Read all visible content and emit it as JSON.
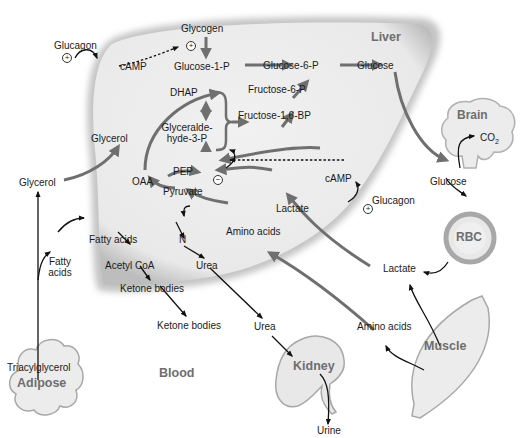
{
  "figure": {
    "compartments": {
      "liver": "Liver",
      "brain": "Brain",
      "rbc": "RBC",
      "muscle": "Muscle",
      "kidney": "Kidney",
      "adipose": "Adipose",
      "blood": "Blood"
    },
    "liver_metabolites": {
      "glycogen": "Glycogen",
      "camp_top": "cAMP",
      "glucose_1_p": "Glucose-1-P",
      "glucose_6_p": "Glucose-6-P",
      "glucose": "Glucose",
      "fructose_6_p": "Fructose-6-P",
      "fructose_16_bp": "Fructose-1,6-BP",
      "dhap": "DHAP",
      "glyceraldehyde_1": "Glyceralde-",
      "glyceraldehyde_2": "hyde-3-P",
      "glycerol": "Glycerol",
      "pep": "PEP",
      "oaa": "OAA",
      "pyruvate": "Pyruvate",
      "camp_mid": "cAMP",
      "lactate": "Lactate",
      "amino_acids": "Amino acids",
      "n": "N",
      "urea": "Urea",
      "fatty_acids": "Fatty acids",
      "acetyl_coa": "Acetyl CoA",
      "ketone_bodies": "Ketone bodies"
    },
    "blood_metabolites": {
      "glucagon_top": "Glucagon",
      "glucagon_mid": "Glucagon",
      "glycerol": "Glycerol",
      "fatty_acids_1": "Fatty",
      "fatty_acids_2": "acids",
      "triacylglycerol": "Triacylglycerol",
      "ketone_bodies": "Ketone bodies",
      "urea": "Urea",
      "urine": "Urine",
      "amino_acids": "Amino acids",
      "lactate": "Lactate",
      "glucose": "Glucose",
      "co2": "CO",
      "co2_sub": "2"
    },
    "regulation": {
      "plus": "+",
      "minus": "−"
    },
    "colors": {
      "liver_fill": "#ececec",
      "liver_edge": "#b8b8b8",
      "organ_text": "#6e6e6e",
      "gray_arrow": "#6f6f6f",
      "black_arrow": "#111111"
    }
  }
}
